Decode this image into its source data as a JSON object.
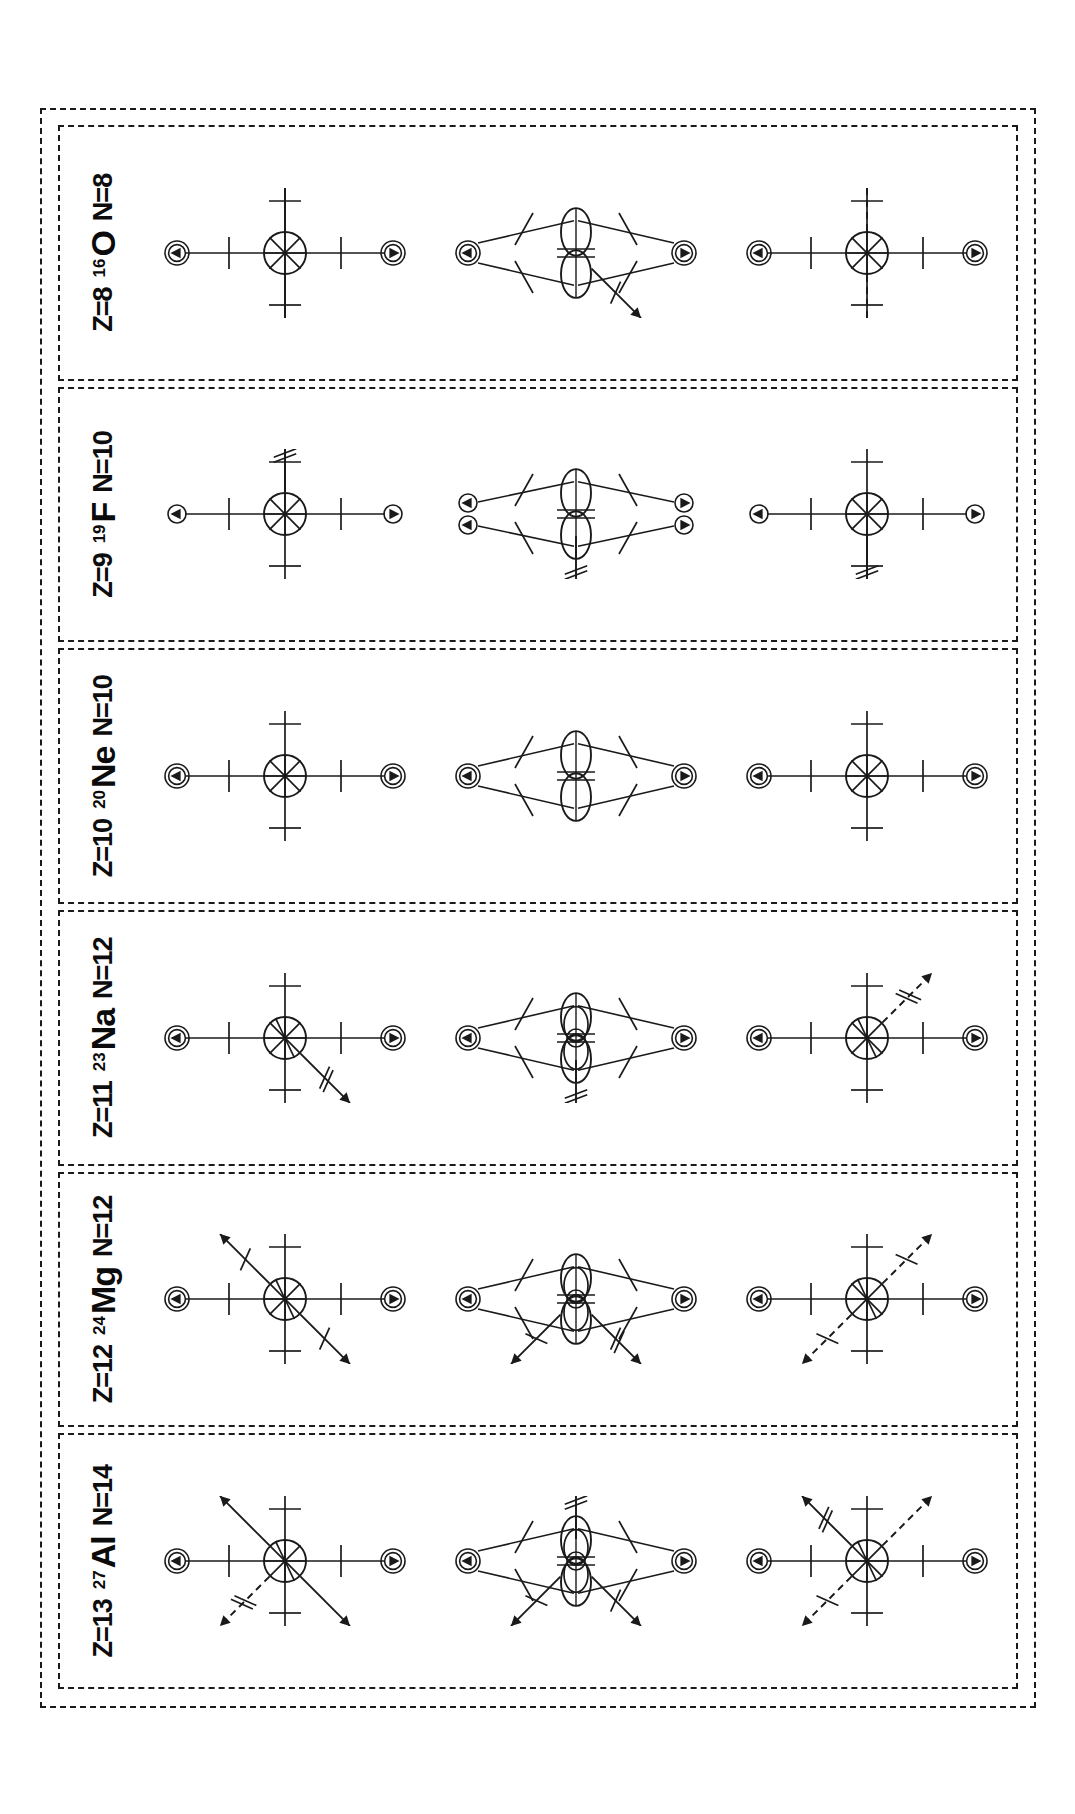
{
  "figure": {
    "type": "nuclear-structure-schematic",
    "orientation": "rotated-90-ccw",
    "outer_border_style": "dashed",
    "panel_border_style": "dashed",
    "stroke_color": "#1a1a1a",
    "background": "#ffffff",
    "row_count": 3,
    "row_descriptions": [
      "spherical core with spin-orbit cross and valence arrows",
      "deformed (prolate/lobed) cluster configuration with paired nucleon arrows",
      "spherical core with dashed valence-hole arrows"
    ]
  },
  "panels": [
    {
      "id": "al-27",
      "mass_number": "27",
      "symbol": "Al",
      "z_label": "Z=13",
      "n_label": "N=14",
      "rows": [
        {
          "name": "row-top",
          "core": "sliced-circle",
          "axis_arrows": [
            "up-circled",
            "down-circled",
            "left-circled",
            "right-circled"
          ],
          "diagonals": [
            {
              "dir": "ne",
              "style": "solid",
              "head": "single",
              "slashes": 0
            },
            {
              "dir": "sw",
              "style": "solid",
              "head": "single",
              "slashes": 0
            },
            {
              "dir": "nw",
              "style": "dashed",
              "head": "single",
              "slashes": 2
            }
          ]
        },
        {
          "name": "row-middle",
          "core": "multi-lobe-cluster",
          "axis_arrows": [
            "up-circled",
            "down-circled"
          ],
          "diagonals": [
            {
              "dir": "nw",
              "style": "solid",
              "head": "single",
              "slashes": 1
            },
            {
              "dir": "sw",
              "style": "solid",
              "head": "single",
              "slashes": 1
            },
            {
              "dir": "e",
              "style": "solid",
              "head": "single",
              "slashes": 2
            }
          ]
        },
        {
          "name": "row-bottom",
          "core": "sliced-circle",
          "axis_arrows": [
            "up-circled",
            "down-circled",
            "left-circled",
            "right-circled"
          ],
          "diagonals": [
            {
              "dir": "nw",
              "style": "dashed",
              "head": "single",
              "slashes": 1
            },
            {
              "dir": "se",
              "style": "dashed",
              "head": "single",
              "slashes": 0
            },
            {
              "dir": "ne",
              "style": "solid",
              "head": "single",
              "slashes": 2
            }
          ]
        }
      ]
    },
    {
      "id": "mg-24",
      "mass_number": "24",
      "symbol": "Mg",
      "z_label": "Z=12",
      "n_label": "N=12",
      "rows": [
        {
          "name": "row-top",
          "core": "sliced-circle",
          "axis_arrows": [
            "up-circled",
            "down-circled",
            "left-circled",
            "right-circled"
          ],
          "diagonals": [
            {
              "dir": "ne",
              "style": "solid",
              "head": "single",
              "slashes": 1
            },
            {
              "dir": "sw",
              "style": "solid",
              "head": "single",
              "slashes": 1
            }
          ]
        },
        {
          "name": "row-middle",
          "core": "multi-lobe-cluster",
          "axis_arrows": [
            "up-circled",
            "down-circled"
          ],
          "diagonals": [
            {
              "dir": "nw",
              "style": "solid",
              "head": "single",
              "slashes": 1
            },
            {
              "dir": "sw",
              "style": "solid",
              "head": "single",
              "slashes": 2
            }
          ]
        },
        {
          "name": "row-bottom",
          "core": "sliced-circle",
          "axis_arrows": [
            "up-circled",
            "down-circled",
            "left-circled",
            "right-circled"
          ],
          "diagonals": [
            {
              "dir": "nw",
              "style": "dashed",
              "head": "single",
              "slashes": 1
            },
            {
              "dir": "se",
              "style": "dashed",
              "head": "single",
              "slashes": 1
            }
          ]
        }
      ]
    },
    {
      "id": "na-23",
      "mass_number": "23",
      "symbol": "Na",
      "z_label": "Z=11",
      "n_label": "N=12",
      "rows": [
        {
          "name": "row-top",
          "core": "sliced-circle",
          "axis_arrows": [
            "up-circled",
            "down-circled",
            "left-circled",
            "right-circled"
          ],
          "diagonals": [
            {
              "dir": "sw",
              "style": "solid",
              "head": "single",
              "slashes": 2
            }
          ]
        },
        {
          "name": "row-middle",
          "core": "multi-lobe-cluster",
          "axis_arrows": [
            "up-circled",
            "down-circled"
          ],
          "diagonals": [
            {
              "dir": "w",
              "style": "solid",
              "head": "single",
              "slashes": 2
            }
          ]
        },
        {
          "name": "row-bottom",
          "core": "sliced-circle",
          "axis_arrows": [
            "up-circled",
            "down-circled",
            "left-circled",
            "right-circled"
          ],
          "diagonals": [
            {
              "dir": "se",
              "style": "dashed",
              "head": "single",
              "slashes": 2
            }
          ]
        }
      ]
    },
    {
      "id": "ne-20",
      "mass_number": "20",
      "symbol": "Ne",
      "z_label": "Z=10",
      "n_label": "N=10",
      "rows": [
        {
          "name": "row-top",
          "core": "cross-circle",
          "axis_arrows": [
            "up-circled",
            "down-circled",
            "left-circled",
            "right-circled"
          ],
          "diagonals": []
        },
        {
          "name": "row-middle",
          "core": "lobe-cluster",
          "axis_arrows": [
            "up-circled",
            "down-circled"
          ],
          "diagonals": []
        },
        {
          "name": "row-bottom",
          "core": "cross-circle",
          "axis_arrows": [
            "up-circled",
            "down-circled",
            "left-circled",
            "right-circled"
          ],
          "diagonals": []
        }
      ]
    },
    {
      "id": "f-19",
      "mass_number": "19",
      "symbol": "F",
      "z_label": "Z=9",
      "n_label": "N=10",
      "rows": [
        {
          "name": "row-top",
          "core": "cross-circle",
          "axis_arrows": [
            "up-small",
            "down-small",
            "left-small",
            "right-open"
          ],
          "diagonals": [
            {
              "dir": "e",
              "style": "solid",
              "head": "single",
              "slashes": 2
            }
          ]
        },
        {
          "name": "row-middle",
          "core": "lobe-cluster-paired",
          "axis_arrows": [
            "up-pair",
            "down-pair"
          ],
          "diagonals": [
            {
              "dir": "w",
              "style": "solid",
              "head": "single",
              "slashes": 2
            }
          ]
        },
        {
          "name": "row-bottom",
          "core": "cross-circle",
          "axis_arrows": [
            "up-small",
            "down-small",
            "right-small",
            "left-open"
          ],
          "diagonals": [
            {
              "dir": "w",
              "style": "solid",
              "head": "single",
              "slashes": 2
            }
          ]
        }
      ]
    },
    {
      "id": "o-16",
      "mass_number": "16",
      "symbol": "O",
      "z_label": "Z=8",
      "n_label": "N=8",
      "rows": [
        {
          "name": "row-top",
          "core": "cross-circle",
          "axis_arrows": [
            "up-circled",
            "down-circled"
          ],
          "diagonals": [
            {
              "dir": "w",
              "style": "solid",
              "head": "single",
              "slashes": 0
            },
            {
              "dir": "e",
              "style": "solid",
              "head": "single",
              "slashes": 0
            }
          ]
        },
        {
          "name": "row-middle",
          "core": "lobe-cluster",
          "axis_arrows": [
            "up-circled",
            "down-circled"
          ],
          "diagonals": [
            {
              "dir": "sw",
              "style": "solid",
              "head": "single",
              "slashes": 1
            }
          ]
        },
        {
          "name": "row-bottom",
          "core": "cross-circle",
          "axis_arrows": [
            "up-circled",
            "down-circled"
          ],
          "diagonals": [
            {
              "dir": "w",
              "style": "dashed",
              "head": "single",
              "slashes": 0
            },
            {
              "dir": "e",
              "style": "dashed",
              "head": "single",
              "slashes": 0
            }
          ]
        }
      ]
    }
  ]
}
